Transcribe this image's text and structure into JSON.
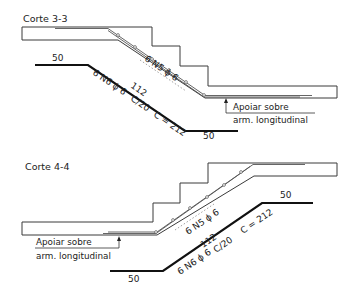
{
  "sections": [
    {
      "title": "Corte 3-3",
      "top_bar": {
        "label": "6 N5 ϕ 6"
      },
      "bottom_bar": {
        "label": "6 N6 ϕ 6",
        "length_label": "112",
        "spacing_label": "C/20",
        "total_label": "C = 212",
        "left_hook": "50",
        "right_hook": "50"
      },
      "note": {
        "line1": "Apoiar sobre",
        "line2": "arm. longitudinal"
      }
    },
    {
      "title": "Corte 4-4",
      "top_bar": {
        "label": "6 N5 ϕ 6"
      },
      "bottom_bar": {
        "label": "6 N6 ϕ 6",
        "length_label": "112",
        "spacing_label": "C/20",
        "total_label": "C = 212",
        "left_hook": "50",
        "right_hook": "50"
      },
      "note": {
        "line1": "Apoiar sobre",
        "line2": "arm. longitudinal"
      }
    }
  ]
}
